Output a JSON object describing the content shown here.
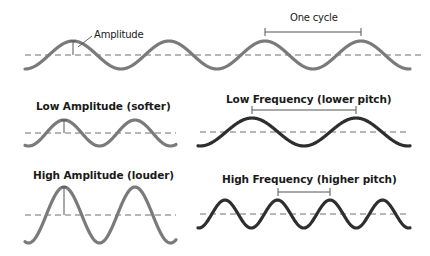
{
  "colors": {
    "background": "#ffffff",
    "wave_gray": "#7a7a7a",
    "wave_dark": "#2e2e2e",
    "baseline": "#6e6e6e",
    "marker": "#555555",
    "text": "#1a1a1a"
  },
  "labels": {
    "amplitude": "Amplitude",
    "one_cycle": "One cycle",
    "low_amplitude": "Low Amplitude (softer)",
    "low_frequency": "Low Frequency (lower pitch)",
    "high_amplitude": "High Amplitude (louder)",
    "high_frequency": "High Frequency (higher pitch)"
  },
  "waves": [
    {
      "id": "reference",
      "x0": 25,
      "x1": 410,
      "baseline": 55,
      "amplitude": 14,
      "period": 96,
      "peak_x": 73,
      "color": "wave_gray",
      "width": 3.2
    },
    {
      "id": "low-amplitude",
      "x0": 25,
      "x1": 176,
      "baseline": 133,
      "amplitude": 13,
      "period": 71,
      "peak_x": 64,
      "color": "wave_gray",
      "width": 3.2
    },
    {
      "id": "high-amplitude",
      "x0": 25,
      "x1": 176,
      "baseline": 215,
      "amplitude": 28,
      "period": 71,
      "peak_x": 64,
      "color": "wave_gray",
      "width": 3.2
    },
    {
      "id": "low-frequency",
      "x0": 198,
      "x1": 410,
      "baseline": 132,
      "amplitude": 14,
      "period": 104,
      "peak_x": 252,
      "color": "wave_dark",
      "width": 3.2
    },
    {
      "id": "high-frequency",
      "x0": 198,
      "x1": 410,
      "baseline": 214,
      "amplitude": 14,
      "period": 52.5,
      "peak_x": 225,
      "color": "wave_dark",
      "width": 3.2
    }
  ],
  "baselines": [
    {
      "x0": 25,
      "x1": 425,
      "y": 55
    },
    {
      "x0": 25,
      "x1": 176,
      "y": 133
    },
    {
      "x0": 200,
      "x1": 410,
      "y": 132
    },
    {
      "x0": 25,
      "x1": 176,
      "y": 215
    },
    {
      "x0": 200,
      "x1": 410,
      "y": 214
    }
  ],
  "amplitude_markers": [
    {
      "x": 73,
      "y_top": 41,
      "y_bottom": 55
    },
    {
      "x": 64,
      "y_top": 120,
      "y_bottom": 133
    },
    {
      "x": 64,
      "y_top": 187,
      "y_bottom": 215
    }
  ],
  "cycle_brackets": [
    {
      "x0": 265,
      "x1": 361,
      "y": 32
    },
    {
      "x0": 252,
      "x1": 356,
      "y": 110
    },
    {
      "x0": 278,
      "x1": 330,
      "y": 192
    }
  ],
  "amplitude_leader": {
    "x0": 78,
    "y0": 47,
    "x1": 92,
    "y1": 36
  }
}
